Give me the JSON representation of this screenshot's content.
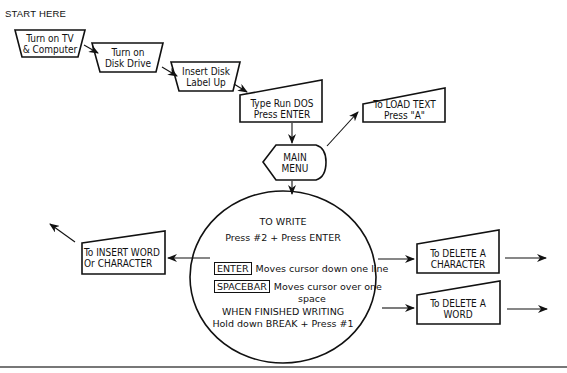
{
  "start_label": "START HERE",
  "steps": [
    {
      "lines": [
        "Turn on TV",
        "& Computer"
      ]
    },
    {
      "lines": [
        "Turn on",
        "Disk Drive"
      ]
    },
    {
      "lines": [
        "Insert Disk",
        "Label Up"
      ]
    },
    {
      "lines": [
        "Type Run DOS",
        "Press ENTER"
      ]
    }
  ],
  "main_menu": {
    "lines": [
      "MAIN",
      "MENU"
    ]
  },
  "load_text": {
    "lines": [
      "To LOAD TEXT",
      "Press \"A\""
    ]
  },
  "write": {
    "title": "TO WRITE",
    "subtitle": "Press #2 + Press ENTER",
    "keys": [
      {
        "key": "ENTER",
        "desc": "Moves cursor down one line"
      },
      {
        "key": "SPACEBAR",
        "desc": "Moves cursor over one",
        "desc2": "space"
      }
    ],
    "finish_title": "WHEN FINISHED WRITING",
    "finish_desc": "Hold down BREAK + Press #1"
  },
  "insert": {
    "lines": [
      "To INSERT WORD",
      "Or CHARACTER"
    ]
  },
  "delete_char": {
    "lines": [
      "To DELETE A",
      "CHARACTER"
    ]
  },
  "delete_word": {
    "lines": [
      "To DELETE A",
      "WORD"
    ]
  }
}
